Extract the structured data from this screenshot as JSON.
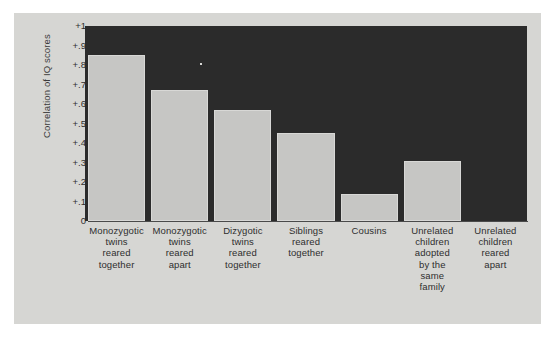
{
  "chart_data": {
    "type": "bar",
    "title": "",
    "xlabel": "",
    "ylabel": "Correlation of IQ scores",
    "ylim": [
      0,
      1
    ],
    "grid": false,
    "legend": "none",
    "ytick_labels": [
      "+1",
      "+.9",
      "+.8",
      "+.7",
      "+.6",
      "+.5",
      "+.4",
      "+.3",
      "+.2",
      "+.1",
      "0"
    ],
    "ytick_values": [
      1,
      0.9,
      0.8,
      0.7,
      0.6,
      0.5,
      0.4,
      0.3,
      0.2,
      0.1,
      0
    ],
    "categories": [
      "Monozygotic twins reared together",
      "Monozygotic twins reared apart",
      "Dizygotic twins reared together",
      "Siblings reared together",
      "Cousins",
      "Unrelated children adopted by the same family",
      "Unrelated children reared apart"
    ],
    "category_lines": [
      [
        "Monozygotic",
        "twins",
        "reared",
        "together"
      ],
      [
        "Monozygotic",
        "twins",
        "reared",
        "apart"
      ],
      [
        "Dizygotic",
        "twins",
        "reared",
        "together"
      ],
      [
        "Siblings",
        "reared",
        "together"
      ],
      [
        "Cousins"
      ],
      [
        "Unrelated",
        "children",
        "adopted",
        "by the",
        "same",
        "family"
      ],
      [
        "Unrelated",
        "children",
        "reared",
        "apart"
      ]
    ],
    "values": [
      0.85,
      0.67,
      0.57,
      0.45,
      0.14,
      0.31,
      0
    ]
  },
  "colors": {
    "page_background": "#ffffff",
    "figure_background": "#d6d6d3",
    "plot_background": "#2b2b2b",
    "bar_fill": "#c6c6c4",
    "bar_edge": "#d8d8d6",
    "text": "#2e2e2e",
    "axis_line": "#4a4a4a"
  }
}
